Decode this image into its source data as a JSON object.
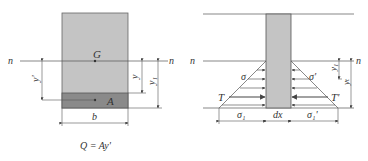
{
  "left_figure": {
    "neutral_axis_left": "n",
    "neutral_axis_right": "n",
    "centroid_label": "G",
    "area_label": "A",
    "y_prime_label": "y'",
    "y_label": "y",
    "y1_label": "y₁",
    "width_label": "b",
    "formula": "Q = Ay'"
  },
  "right_figure": {
    "neutral_axis_left": "n",
    "neutral_axis_right": "n",
    "sigma_left": "σ",
    "sigma_right": "σ'",
    "force_left": "T",
    "force_right": "T'",
    "sigma1_left": "σ₁",
    "sigma1_right": "σ₁'",
    "dx_label": "dx",
    "y1_label": "y₁",
    "yt_label": "yₜ"
  },
  "colors": {
    "section_fill": "#c4c4c4",
    "band_fill": "#8a8a8a",
    "line": "#555555"
  }
}
